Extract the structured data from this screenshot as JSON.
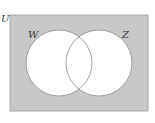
{
  "diagram": {
    "type": "venn",
    "universe_label": "U",
    "sets": [
      {
        "label": "W"
      },
      {
        "label": "Z"
      }
    ],
    "shaded_region": "complement of W union Z",
    "colors": {
      "shade": "#c8c8c8",
      "circle_fill": "#ffffff",
      "stroke": "#8a8a8a",
      "text": "#333333"
    }
  }
}
